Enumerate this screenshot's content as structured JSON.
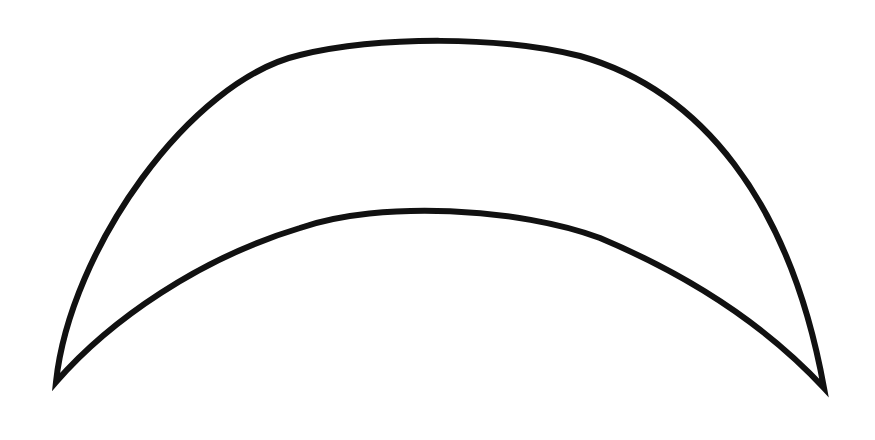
{
  "diagram": {
    "shape": "crescent",
    "stroke_color": "#111111",
    "fill_color": "#ffffff",
    "background_color": "#ffffff",
    "stroke_width": 6
  }
}
